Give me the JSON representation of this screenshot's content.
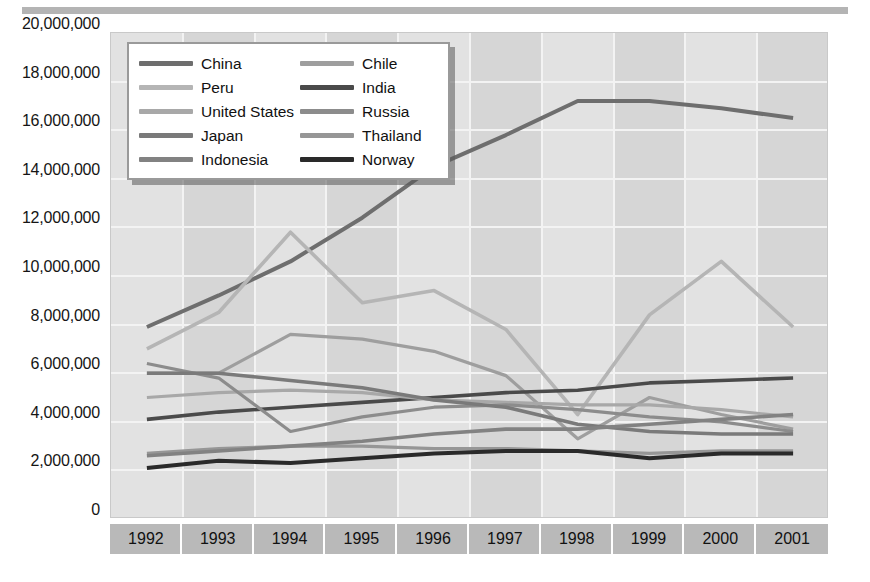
{
  "chart_data": {
    "type": "line",
    "title": "",
    "subtitle": "",
    "xlabel": "",
    "ylabel": "",
    "x": [
      "1992",
      "1993",
      "1994",
      "1995",
      "1996",
      "1997",
      "1998",
      "1999",
      "2000",
      "2001"
    ],
    "categories": [
      "1992",
      "1993",
      "1994",
      "1995",
      "1996",
      "1997",
      "1998",
      "1999",
      "2000",
      "2001"
    ],
    "ylim": [
      0,
      20000000
    ],
    "ytick_values": [
      0,
      2000000,
      4000000,
      6000000,
      8000000,
      10000000,
      12000000,
      14000000,
      16000000,
      18000000,
      20000000
    ],
    "ytick_labels": [
      "0",
      "2,000,000",
      "4,000,000",
      "6,000,000",
      "8,000,000",
      "10,000,000",
      "12,000,000",
      "14,000,000",
      "16,000,000",
      "18,000,000",
      "20,000,000"
    ],
    "grid": true,
    "legend_position": "top-left-inside",
    "legend_columns": 2,
    "series": [
      {
        "name": "China",
        "color": "#6e6e6e",
        "width": 4.0,
        "values": [
          7900000,
          9200000,
          10600000,
          12400000,
          14500000,
          15800000,
          17200000,
          17200000,
          16900000,
          16500000
        ]
      },
      {
        "name": "Chile",
        "color": "#9e9e9e",
        "width": 3.2,
        "values": [
          6000000,
          6000000,
          7600000,
          7400000,
          6900000,
          5900000,
          3300000,
          5000000,
          4300000,
          3700000
        ]
      },
      {
        "name": "Peru",
        "color": "#b5b5b5",
        "width": 3.6,
        "values": [
          7000000,
          8500000,
          11800000,
          8900000,
          9400000,
          7800000,
          4300000,
          8400000,
          10600000,
          7900000
        ]
      },
      {
        "name": "India",
        "color": "#4a4a4a",
        "width": 3.6,
        "values": [
          4100000,
          4400000,
          4600000,
          4800000,
          5000000,
          5200000,
          5300000,
          5600000,
          5700000,
          5800000
        ]
      },
      {
        "name": "United States",
        "color": "#a8a8a8",
        "width": 3.2,
        "values": [
          5000000,
          5200000,
          5300000,
          5200000,
          4900000,
          4800000,
          4700000,
          4700000,
          4500000,
          4200000
        ]
      },
      {
        "name": "Russia",
        "color": "#8c8c8c",
        "width": 3.2,
        "values": [
          6400000,
          5800000,
          3600000,
          4200000,
          4600000,
          4700000,
          4500000,
          4200000,
          4000000,
          3600000
        ]
      },
      {
        "name": "Japan",
        "color": "#7a7a7a",
        "width": 3.6,
        "values": [
          6000000,
          6000000,
          5700000,
          5400000,
          4900000,
          4600000,
          3900000,
          3600000,
          3500000,
          3500000
        ]
      },
      {
        "name": "Thailand",
        "color": "#969696",
        "width": 3.2,
        "values": [
          2700000,
          2900000,
          3000000,
          3000000,
          2900000,
          2900000,
          2800000,
          2700000,
          2800000,
          2800000
        ]
      },
      {
        "name": "Indonesia",
        "color": "#828282",
        "width": 3.6,
        "values": [
          2600000,
          2800000,
          3000000,
          3200000,
          3500000,
          3700000,
          3700000,
          3900000,
          4100000,
          4300000
        ]
      },
      {
        "name": "Norway",
        "color": "#2a2a2a",
        "width": 4.0,
        "values": [
          2100000,
          2400000,
          2300000,
          2500000,
          2700000,
          2800000,
          2800000,
          2500000,
          2700000,
          2700000
        ]
      }
    ],
    "annotations": []
  },
  "legend": {
    "items": [
      {
        "label": "China",
        "swatch": "#6e6e6e"
      },
      {
        "label": "Chile",
        "swatch": "#9e9e9e"
      },
      {
        "label": "Peru",
        "swatch": "#b5b5b5"
      },
      {
        "label": "India",
        "swatch": "#4a4a4a"
      },
      {
        "label": "United States",
        "swatch": "#a8a8a8"
      },
      {
        "label": "Russia",
        "swatch": "#8c8c8c"
      },
      {
        "label": "Japan",
        "swatch": "#7a7a7a"
      },
      {
        "label": "Thailand",
        "swatch": "#969696"
      },
      {
        "label": "Indonesia",
        "swatch": "#828282"
      },
      {
        "label": "Norway",
        "swatch": "#2a2a2a"
      }
    ]
  },
  "colors": {
    "plot_background": "#e2e2e2",
    "band_shade": "#d6d6d6",
    "gridline": "#f3f3f3",
    "axis_band": "#b9b9b9",
    "top_rule": "#b4b4b4",
    "page_background": "#ffffff",
    "text": "#111111"
  }
}
